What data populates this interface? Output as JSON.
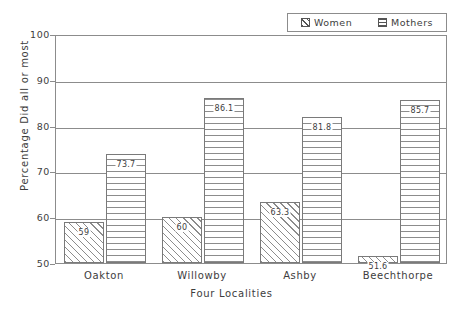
{
  "chart_data": {
    "type": "bar",
    "title": "",
    "subtitle": "",
    "xlabel": "Four Localities",
    "ylabel": "Percentage Did all or most",
    "categories": [
      "Oakton",
      "Willowby",
      "Ashby",
      "Beechthorpe"
    ],
    "series": [
      {
        "name": "Women",
        "pattern": "diagonal-hatch",
        "values": [
          59,
          60,
          63.3,
          51.6
        ],
        "labels": [
          "59",
          "60",
          "63.3",
          "51.6"
        ]
      },
      {
        "name": "Mothers",
        "pattern": "horizontal-hatch",
        "values": [
          73.7,
          86.1,
          81.8,
          85.7
        ],
        "labels": [
          "73.7",
          "86.1",
          "81.8",
          "85.7"
        ]
      }
    ],
    "ylim": [
      50,
      100
    ],
    "yticks": [
      "100",
      "90",
      "80",
      "70",
      "60",
      "50"
    ],
    "ytick_values": [
      100,
      90,
      80,
      70,
      60,
      50
    ],
    "grid": true,
    "grid_axis": "y",
    "legend_position": "top-right",
    "colors": {
      "axis": "#8c8c8c",
      "text": "#3d3d3d",
      "bar_outline": "#7a7a7a",
      "hatch": "#8c8c8c",
      "background": "#ffffff"
    }
  },
  "legend": {
    "entries": [
      {
        "label": "Women",
        "swatch": "diagonal-hatch-swatch"
      },
      {
        "label": "Mothers",
        "swatch": "horizontal-hatch-swatch"
      }
    ]
  }
}
